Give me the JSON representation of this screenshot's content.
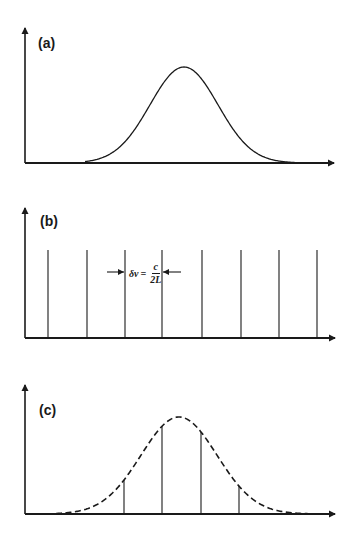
{
  "colors": {
    "ink": "#1a1a1a",
    "background": "#ffffff"
  },
  "panels": [
    {
      "id": "a",
      "label": "(a)",
      "description": "Gain bandwidth / Gaussian gain profile",
      "axes": {
        "origin_x": 25,
        "baseline_y": 163,
        "y_top": 25,
        "x_end": 337
      },
      "label_pos": {
        "x": 38,
        "y": 36
      },
      "curve": {
        "style": "solid",
        "center_x": 184,
        "peak_y": 67,
        "sigma": 34,
        "x_start": 85,
        "x_end": 298
      }
    },
    {
      "id": "b",
      "label": "(b)",
      "description": "Longitudinal cavity modes",
      "axes": {
        "origin_x": 25,
        "baseline_y": 338,
        "y_top": 205,
        "x_end": 338
      },
      "label_pos": {
        "x": 40,
        "y": 214
      },
      "mode_lines": {
        "x": [
          48,
          87,
          125,
          162,
          202,
          241,
          279,
          317
        ],
        "top_y": 250
      },
      "annotation": {
        "symbol": "δν",
        "equals": "=",
        "numerator": "c",
        "denominator": "2L",
        "arrow_left_from": 107,
        "arrow_right_from": 181,
        "y": 272,
        "text_x": 129,
        "text_y": 262
      }
    },
    {
      "id": "c",
      "label": "(c)",
      "description": "Lasing modes under the gain envelope",
      "axes": {
        "origin_x": 25,
        "baseline_y": 514,
        "y_top": 382,
        "x_end": 338
      },
      "label_pos": {
        "x": 39,
        "y": 403
      },
      "curve": {
        "style": "dashed",
        "center_x": 179,
        "peak_y": 417,
        "sigma": 38,
        "x_start": 56,
        "x_end": 310
      },
      "mode_lines": {
        "x": [
          124,
          162,
          201,
          239
        ]
      }
    }
  ],
  "chart_data": [
    {
      "type": "line",
      "title": "(a)",
      "series": [
        {
          "name": "gain profile",
          "shape": "gaussian",
          "style": "solid",
          "center": 0.51,
          "relative_peak": 0.7
        }
      ],
      "xlabel": "",
      "ylabel": "",
      "grid": false
    },
    {
      "type": "bar",
      "title": "(b)",
      "categories": [
        "m1",
        "m2",
        "m3",
        "m4",
        "m5",
        "m6",
        "m7",
        "m8"
      ],
      "values": [
        1,
        1,
        1,
        1,
        1,
        1,
        1,
        1
      ],
      "annotation": "δν = c/2L",
      "xlabel": "",
      "ylabel": "",
      "grid": false
    },
    {
      "type": "line",
      "title": "(c)",
      "series": [
        {
          "name": "gain envelope",
          "shape": "gaussian",
          "style": "dashed",
          "relative_peak": 0.73
        },
        {
          "name": "lasing modes",
          "style": "stem",
          "relative_heights": [
            0.22,
            0.66,
            0.66,
            0.22
          ]
        }
      ],
      "xlabel": "",
      "ylabel": "",
      "grid": false
    }
  ]
}
